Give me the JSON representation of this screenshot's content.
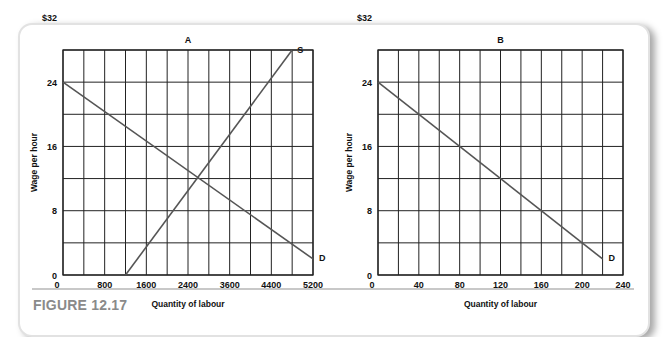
{
  "figure": {
    "caption": "FIGURE 12.17"
  },
  "chart_data": [
    {
      "type": "line",
      "title": "A",
      "xlabel": "Quantity of labour",
      "ylabel": "Wage per hour",
      "x_tick_labels": [
        "0",
        "800",
        "1600",
        "2400",
        "3600",
        "4400",
        "5200"
      ],
      "y_tick_labels": [
        "0",
        "8",
        "16",
        "24",
        "$32"
      ],
      "grid": true,
      "grid_columns": 12,
      "grid_rows": 7,
      "series": [
        {
          "name": "D",
          "points": [
            [
              0,
              24
            ],
            [
              4800,
              2
            ]
          ],
          "label": "D"
        },
        {
          "name": "S",
          "points": [
            [
              1200,
              0
            ],
            [
              4400,
              28
            ]
          ],
          "label": "S"
        }
      ],
      "equilibrium": {
        "x": 2400,
        "y": 12
      }
    },
    {
      "type": "line",
      "title": "B",
      "xlabel": "Quantity of labour",
      "ylabel": "Wage per hour",
      "x_tick_labels": [
        "0",
        "40",
        "80",
        "120",
        "160",
        "200",
        "240"
      ],
      "y_tick_labels": [
        "0",
        "8",
        "16",
        "24",
        "$32"
      ],
      "grid": true,
      "grid_columns": 12,
      "grid_rows": 7,
      "series": [
        {
          "name": "D",
          "points": [
            [
              0,
              24
            ],
            [
              220,
              2
            ]
          ],
          "label": "D"
        }
      ]
    }
  ],
  "colors": {
    "line": "#555555",
    "grid": "#222222",
    "caption": "#8a8a8a"
  }
}
